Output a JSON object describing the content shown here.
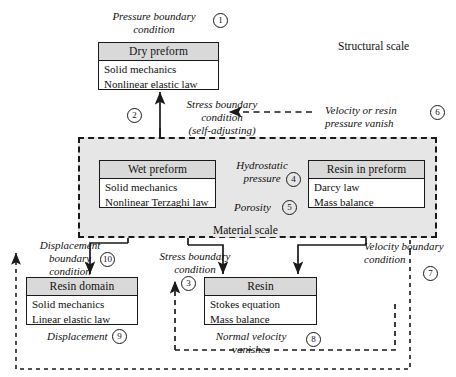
{
  "diagram": {
    "scales": {
      "structural": "Structural scale",
      "material": "Material scale"
    },
    "boxes": [
      {
        "id": "dry-preform",
        "header": "Dry preform",
        "lines": [
          "Solid mechanics",
          "Nonlinear elastic law"
        ]
      },
      {
        "id": "wet-preform",
        "header": "Wet preform",
        "lines": [
          "Solid mechanics",
          "Nonlinear Terzaghi law"
        ]
      },
      {
        "id": "resin-in-preform",
        "header": "Resin in preform",
        "lines": [
          "Darcy law",
          "Mass balance"
        ]
      },
      {
        "id": "resin-domain",
        "header": "Resin domain",
        "lines": [
          "Solid mechanics",
          "Linear elastic law"
        ]
      },
      {
        "id": "resin",
        "header": "Resin",
        "lines": [
          "Stokes equation",
          "Mass balance"
        ]
      }
    ],
    "labels": {
      "pressure_boundary_condition": "Pressure boundary\ncondition",
      "stress_boundary_condition_self": "Stress boundary\ncondition\n(self-adjusting)",
      "velocity_or_resin_pressure_vanish": "Velocity or resin\npressure vanish",
      "hydrostatic_pressure": "Hydrostatic\npressure",
      "porosity": "Porosity",
      "displacement_boundary_condition": "Displacement\nboundary\ncondition",
      "stress_boundary_condition": "Stress boundary\ncondition",
      "velocity_boundary_condition": "Velocity boundary\ncondition",
      "displacement": "Displacement",
      "normal_velocity_vanishes": "Normal velocity\nvanishes"
    },
    "markers": {
      "m1": "1",
      "m2": "2",
      "m3": "3",
      "m4": "4",
      "m5": "5",
      "m6": "6",
      "m7": "7",
      "m8": "8",
      "m9": "9",
      "m10": "10"
    },
    "colors": {
      "stroke": "#1a1a1a",
      "header_fill": "#d9d9d9",
      "material_scale_fill": "#e6e6e6",
      "background": "#ffffff"
    }
  }
}
